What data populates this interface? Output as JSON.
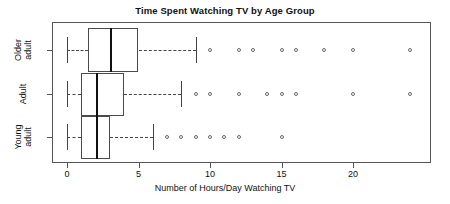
{
  "chart": {
    "title": "Time Spent Watching TV by Age Group",
    "xlabel": "Number of Hours/Day Watching TV",
    "group_labels": [
      "Older\nadult",
      "Adult",
      "Young\nadult"
    ],
    "tick_labels": [
      "0",
      "5",
      "10",
      "15",
      "20"
    ]
  },
  "chart_data": {
    "type": "boxplot",
    "title": "Time Spent Watching TV by Age Group",
    "xlabel": "Number of Hours/Day Watching TV",
    "ylabel": "",
    "orientation": "horizontal",
    "xlim": [
      -0.8,
      25.5
    ],
    "xticks": [
      0,
      5,
      10,
      15,
      20
    ],
    "grid": false,
    "legend": "none",
    "categories": [
      "Older adult",
      "Adult",
      "Young adult"
    ],
    "series": [
      {
        "name": "Older adult",
        "min_whisker": 0,
        "q1": 1.5,
        "median": 3,
        "q3": 5,
        "max_whisker": 9,
        "outliers": [
          10,
          12,
          13,
          15,
          16,
          18,
          20,
          24
        ]
      },
      {
        "name": "Adult",
        "min_whisker": 0,
        "q1": 1,
        "median": 2,
        "q3": 4,
        "max_whisker": 8,
        "outliers": [
          9,
          10,
          12,
          14,
          15,
          16,
          20,
          24
        ]
      },
      {
        "name": "Young adult",
        "min_whisker": 0,
        "q1": 1,
        "median": 2,
        "q3": 3,
        "max_whisker": 6,
        "outliers": [
          7,
          8,
          9,
          10,
          11,
          12,
          15
        ]
      }
    ]
  },
  "colors": {
    "frame": "#555555",
    "box_border": "#4a4a4a",
    "median": "#111111",
    "whisker": "#444444",
    "outlier": "#6a6a6a",
    "background": "#ffffff"
  }
}
